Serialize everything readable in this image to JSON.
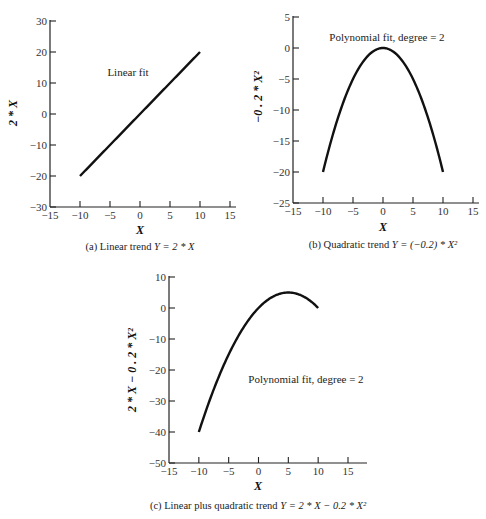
{
  "chart_data": [
    {
      "type": "line",
      "panel": "a",
      "title": "",
      "caption": "(a) Linear trend Y = 2*X",
      "annotation": "Linear fit",
      "xlabel": "X",
      "ylabel": "2*X",
      "xlim": [
        -15,
        15
      ],
      "ylim": [
        -30,
        30
      ],
      "xticks": [
        -15,
        -10,
        -5,
        0,
        5,
        10,
        15
      ],
      "yticks": [
        -30,
        -20,
        -10,
        0,
        10,
        20,
        30
      ],
      "grid": false,
      "series": [
        {
          "name": "2*X",
          "formula": "2*x",
          "x": [
            -10,
            -5,
            0,
            5,
            10
          ],
          "values": [
            -20,
            -10,
            0,
            10,
            20
          ]
        }
      ]
    },
    {
      "type": "line",
      "panel": "b",
      "title": "",
      "caption": "(b) Quadratic trend Y = (-0.2)*X^2",
      "annotation": "Polynomial fit, degree = 2",
      "xlabel": "X",
      "ylabel": "-0.2*X^2",
      "xlim": [
        -15,
        15
      ],
      "ylim": [
        -25,
        5
      ],
      "xticks": [
        -15,
        -10,
        -5,
        0,
        5,
        10,
        15
      ],
      "yticks": [
        -25,
        -20,
        -15,
        -10,
        -5,
        0,
        5
      ],
      "grid": false,
      "series": [
        {
          "name": "-0.2*X^2",
          "formula": "-0.2*x*x",
          "x": [
            -10,
            -5,
            0,
            5,
            10
          ],
          "values": [
            -20,
            -5,
            0,
            -5,
            -20
          ]
        }
      ]
    },
    {
      "type": "line",
      "panel": "c",
      "title": "",
      "caption": "(c) Linear plus quadratic trend Y = 2*X - 0.2*X^2",
      "annotation": "Polynomial fit, degree = 2",
      "xlabel": "X",
      "ylabel": "2*X - 0.2*X^2",
      "xlim": [
        -15,
        15
      ],
      "ylim": [
        -50,
        10
      ],
      "xticks": [
        -15,
        -10,
        -5,
        0,
        5,
        10,
        15
      ],
      "yticks": [
        -50,
        -40,
        -30,
        -20,
        -10,
        0,
        10
      ],
      "grid": false,
      "series": [
        {
          "name": "2*X - 0.2*X^2",
          "formula": "2*x-0.2*x*x",
          "x": [
            -10,
            -5,
            0,
            5,
            10
          ],
          "values": [
            -40,
            -15,
            0,
            5,
            0
          ]
        }
      ]
    }
  ],
  "panels": {
    "a": {
      "annotation": "Linear fit",
      "xlabel": "X",
      "ylabel": "2 * X",
      "caption_prefix": "(a) Linear trend ",
      "caption_eq": "Y = 2 * X"
    },
    "b": {
      "annotation": "Polynomial fit, degree = 2",
      "xlabel": "X",
      "ylabel": "−0 . 2 * X²",
      "caption_prefix": "(b) Quadratic trend ",
      "caption_eq": "Y =  (−0.2) * X²"
    },
    "c": {
      "annotation": "Polynomial fit, degree = 2",
      "xlabel": "X",
      "ylabel": "2 * X − 0 . 2 * X²",
      "caption_prefix": "(c) Linear plus quadratic trend  ",
      "caption_eq": "Y = 2 * X − 0.2 * X²"
    }
  }
}
